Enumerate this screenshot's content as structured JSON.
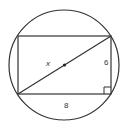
{
  "diagram": {
    "colors": {
      "stroke": "#333333",
      "background": "#ffffff"
    },
    "circle": {
      "cx": 64,
      "cy": 65,
      "r": 55
    },
    "rectangle": {
      "x": 18,
      "y": 36,
      "width": 93,
      "height": 58
    },
    "diagonal": {
      "x1": 18,
      "y1": 94,
      "x2": 111,
      "y2": 36
    },
    "center_point": {
      "cx": 64.5,
      "cy": 65,
      "r": 1.6
    },
    "right_angle_marker": {
      "x": 104,
      "y": 87,
      "size": 7
    },
    "labels": {
      "diagonal": {
        "text": "x",
        "x": 46,
        "y": 66
      },
      "height": {
        "text": "6",
        "x": 104,
        "y": 65
      },
      "width": {
        "text": "8",
        "x": 64,
        "y": 108
      }
    }
  }
}
